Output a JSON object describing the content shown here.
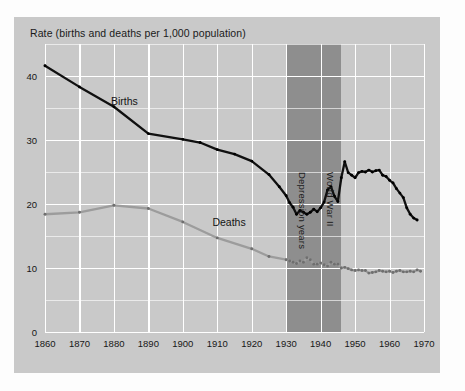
{
  "figure": {
    "title": "Rate (births and deaths per 1,000 population)",
    "background_color": "#c9c9c9",
    "gridline_color": "#ffffff",
    "band_color": "#8e8e8e"
  },
  "series_labels": {
    "births": "Births",
    "deaths": "Deaths"
  },
  "bands": [
    {
      "label": "Depression years",
      "start": 1930,
      "end": 1940
    },
    {
      "label": "World War II",
      "start": 1940,
      "end": 1946
    }
  ],
  "chart_data": {
    "type": "line",
    "title": "Rate (births and deaths per 1,000 population)",
    "xlabel": "",
    "ylabel": "Rate (births and deaths per 1,000 population)",
    "xlim": [
      1860,
      1970
    ],
    "ylim": [
      0,
      45
    ],
    "yticks": [
      0,
      10,
      20,
      30,
      40
    ],
    "yticks_minor": [
      5,
      15,
      25,
      35,
      45
    ],
    "xticks": [
      1860,
      1870,
      1880,
      1890,
      1900,
      1910,
      1920,
      1930,
      1940,
      1950,
      1960,
      1970
    ],
    "grid": true,
    "legend": "inline-labels",
    "series": [
      {
        "name": "Births",
        "color": "#101010",
        "points": [
          [
            1860,
            41.6
          ],
          [
            1870,
            38.3
          ],
          [
            1880,
            35.2
          ],
          [
            1890,
            31.0
          ],
          [
            1900,
            30.1
          ],
          [
            1905,
            29.6
          ],
          [
            1910,
            28.5
          ],
          [
            1915,
            27.8
          ],
          [
            1920,
            26.7
          ],
          [
            1925,
            24.6
          ],
          [
            1928,
            22.7
          ],
          [
            1930,
            21.3
          ],
          [
            1931,
            20.2
          ],
          [
            1932,
            19.5
          ],
          [
            1933,
            18.4
          ],
          [
            1934,
            19.0
          ],
          [
            1935,
            18.7
          ],
          [
            1936,
            18.4
          ],
          [
            1937,
            18.7
          ],
          [
            1938,
            19.2
          ],
          [
            1939,
            18.8
          ],
          [
            1940,
            19.4
          ],
          [
            1941,
            20.3
          ],
          [
            1942,
            22.2
          ],
          [
            1943,
            22.7
          ],
          [
            1944,
            21.2
          ],
          [
            1945,
            20.4
          ],
          [
            1946,
            24.1
          ],
          [
            1947,
            26.6
          ],
          [
            1948,
            24.9
          ],
          [
            1949,
            24.5
          ],
          [
            1950,
            24.1
          ],
          [
            1951,
            24.9
          ],
          [
            1952,
            25.1
          ],
          [
            1953,
            25.0
          ],
          [
            1954,
            25.3
          ],
          [
            1955,
            25.0
          ],
          [
            1956,
            25.2
          ],
          [
            1957,
            25.3
          ],
          [
            1958,
            24.5
          ],
          [
            1959,
            24.3
          ],
          [
            1960,
            23.7
          ],
          [
            1961,
            23.3
          ],
          [
            1962,
            22.4
          ],
          [
            1963,
            21.7
          ],
          [
            1964,
            21.0
          ],
          [
            1965,
            19.4
          ],
          [
            1966,
            18.4
          ],
          [
            1967,
            17.8
          ],
          [
            1968,
            17.5
          ]
        ]
      },
      {
        "name": "Deaths",
        "color": "#9c9c9c",
        "points": [
          [
            1860,
            18.4
          ],
          [
            1870,
            18.7
          ],
          [
            1880,
            19.8
          ],
          [
            1890,
            19.3
          ],
          [
            1900,
            17.2
          ],
          [
            1910,
            14.7
          ],
          [
            1920,
            13.0
          ],
          [
            1925,
            11.8
          ],
          [
            1930,
            11.3
          ],
          [
            1931,
            11.1
          ],
          [
            1932,
            10.9
          ],
          [
            1933,
            10.7
          ],
          [
            1934,
            11.1
          ],
          [
            1935,
            10.9
          ],
          [
            1936,
            11.6
          ],
          [
            1937,
            11.3
          ],
          [
            1938,
            10.6
          ],
          [
            1939,
            10.6
          ],
          [
            1940,
            10.8
          ],
          [
            1941,
            10.5
          ],
          [
            1942,
            10.3
          ],
          [
            1943,
            10.9
          ],
          [
            1944,
            10.6
          ],
          [
            1945,
            10.6
          ],
          [
            1946,
            10.0
          ],
          [
            1947,
            10.1
          ],
          [
            1948,
            9.9
          ],
          [
            1949,
            9.7
          ],
          [
            1950,
            9.6
          ],
          [
            1951,
            9.7
          ],
          [
            1952,
            9.6
          ],
          [
            1953,
            9.6
          ],
          [
            1954,
            9.2
          ],
          [
            1955,
            9.3
          ],
          [
            1956,
            9.4
          ],
          [
            1957,
            9.6
          ],
          [
            1958,
            9.5
          ],
          [
            1959,
            9.4
          ],
          [
            1960,
            9.5
          ],
          [
            1961,
            9.3
          ],
          [
            1962,
            9.5
          ],
          [
            1963,
            9.6
          ],
          [
            1964,
            9.4
          ],
          [
            1965,
            9.4
          ],
          [
            1966,
            9.5
          ],
          [
            1967,
            9.4
          ],
          [
            1968,
            9.7
          ],
          [
            1969,
            9.5
          ]
        ]
      }
    ]
  }
}
